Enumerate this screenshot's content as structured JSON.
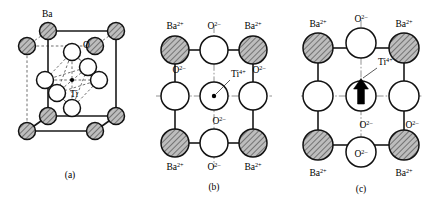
{
  "figure": {
    "bottom_caption": "",
    "colors": {
      "line": "#1a1a1a",
      "dashed": "#555555",
      "center_line": "#777777",
      "hatch_fill": "#a8a8a8",
      "open_fill": "#ffffff",
      "background": "#ffffff"
    }
  },
  "panels": [
    {
      "id": "a",
      "caption": "(a)",
      "type": "unit-cell-3d",
      "labels": {
        "ba": "Ba",
        "o": "O",
        "ti": "Ti"
      },
      "atoms": {
        "ba_corner_count": 8,
        "o_face_count": 6,
        "ti_center_count": 1
      }
    },
    {
      "id": "b",
      "caption": "(b)",
      "type": "cubic-projection",
      "ion_labels": {
        "ba": "Ba",
        "ba_charge": "2+",
        "o": "O",
        "o_charge": "2–",
        "ti": "Ti",
        "ti_charge": "4+"
      },
      "corner_labels": [
        "Ba2+",
        "Ba2+",
        "Ba2+",
        "Ba2+"
      ],
      "edge_labels": [
        "O2-",
        "O2-",
        "O2-",
        "O2-"
      ],
      "center_label": "Ti4+",
      "has_displacement_arrow": false
    },
    {
      "id": "c",
      "caption": "(c)",
      "type": "tetragonal-projection",
      "ion_labels": {
        "ba": "Ba",
        "ba_charge": "2+",
        "o": "O",
        "o_charge": "2–",
        "ti": "Ti",
        "ti_charge": "4+"
      },
      "corner_labels": [
        "Ba2+",
        "Ba2+",
        "Ba2+",
        "Ba2+"
      ],
      "edge_labels": [
        "O2-",
        "O2-",
        "O2-",
        "O2-"
      ],
      "center_label": "Ti4+",
      "has_displacement_arrow": true,
      "displacement_direction": "up"
    }
  ]
}
